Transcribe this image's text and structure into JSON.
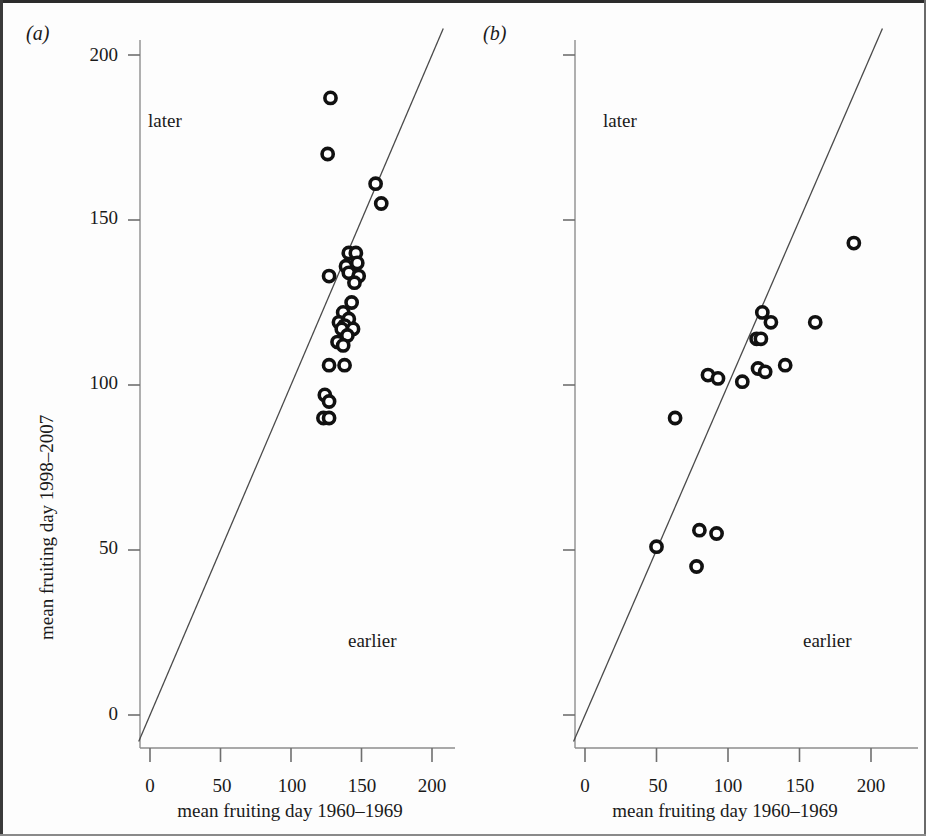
{
  "figure": {
    "panels": [
      {
        "id": "a",
        "label": "(a)",
        "region_later": "later",
        "region_earlier": "earlier",
        "x_axis_label": "mean fruiting day 1960–1969",
        "y_axis_label": "mean fruiting day 1998–2007",
        "x_ticks": [
          "0",
          "50",
          "100",
          "150",
          "200"
        ],
        "y_ticks": [
          "0",
          "50",
          "100",
          "150",
          "200"
        ]
      },
      {
        "id": "b",
        "label": "(b)",
        "region_later": "later",
        "region_earlier": "earlier",
        "x_axis_label": "mean fruiting day 1960–1969",
        "y_axis_label": "",
        "x_ticks": [
          "0",
          "50",
          "100",
          "150",
          "200"
        ],
        "y_ticks": [
          "",
          "",
          "",
          "",
          ""
        ]
      }
    ]
  },
  "chart_data": [
    {
      "type": "scatter",
      "panel": "a",
      "title": "(a)",
      "xlabel": "mean fruiting day 1960–1969",
      "ylabel": "mean fruiting day 1998–2007",
      "xlim": [
        -10,
        212
      ],
      "ylim": [
        -12,
        212
      ],
      "x_ticks": [
        0,
        50,
        100,
        150,
        200
      ],
      "y_ticks": [
        0,
        50,
        100,
        150,
        200
      ],
      "grid": false,
      "legend": null,
      "annotations": [
        {
          "text": "later",
          "x": 32,
          "y": 180
        },
        {
          "text": "earlier",
          "x": 150,
          "y": 22
        }
      ],
      "reference_line": {
        "name": "1:1 line",
        "slope": 1,
        "intercept": 0,
        "x_from": -8,
        "x_to": 208
      },
      "series": [
        {
          "name": "fungal species",
          "marker": "open-circle",
          "points": [
            [
              128,
              187
            ],
            [
              126,
              170
            ],
            [
              160,
              161
            ],
            [
              164,
              155
            ],
            [
              141,
              140
            ],
            [
              146,
              140
            ],
            [
              147,
              137
            ],
            [
              139,
              136
            ],
            [
              141,
              134
            ],
            [
              148,
              133
            ],
            [
              127,
              133
            ],
            [
              145,
              131
            ],
            [
              143,
              125
            ],
            [
              137,
              122
            ],
            [
              141,
              120
            ],
            [
              134,
              119
            ],
            [
              138,
              118
            ],
            [
              136,
              117
            ],
            [
              144,
              117
            ],
            [
              140,
              115
            ],
            [
              133,
              113
            ],
            [
              137,
              112
            ],
            [
              127,
              106
            ],
            [
              138,
              106
            ],
            [
              124,
              97
            ],
            [
              127,
              95
            ],
            [
              123,
              90
            ],
            [
              127,
              90
            ]
          ]
        }
      ]
    },
    {
      "type": "scatter",
      "panel": "b",
      "title": "(b)",
      "xlabel": "mean fruiting day 1960–1969",
      "ylabel": "",
      "xlim": [
        -10,
        212
      ],
      "ylim": [
        -12,
        212
      ],
      "x_ticks": [
        0,
        50,
        100,
        150,
        200
      ],
      "y_ticks": [
        0,
        50,
        100,
        150,
        200
      ],
      "grid": false,
      "legend": null,
      "annotations": [
        {
          "text": "later",
          "x": 32,
          "y": 180
        },
        {
          "text": "earlier",
          "x": 150,
          "y": 22
        }
      ],
      "reference_line": {
        "name": "1:1 line",
        "slope": 1,
        "intercept": 0,
        "x_from": -8,
        "x_to": 208
      },
      "series": [
        {
          "name": "fungal species",
          "marker": "open-circle",
          "points": [
            [
              188,
              143
            ],
            [
              124,
              122
            ],
            [
              130,
              119
            ],
            [
              161,
              119
            ],
            [
              120,
              114
            ],
            [
              123,
              114
            ],
            [
              140,
              106
            ],
            [
              121,
              105
            ],
            [
              126,
              104
            ],
            [
              110,
              101
            ],
            [
              86,
              103
            ],
            [
              93,
              102
            ],
            [
              63,
              90
            ],
            [
              80,
              56
            ],
            [
              92,
              55
            ],
            [
              50,
              51
            ],
            [
              78,
              45
            ]
          ]
        }
      ]
    }
  ]
}
